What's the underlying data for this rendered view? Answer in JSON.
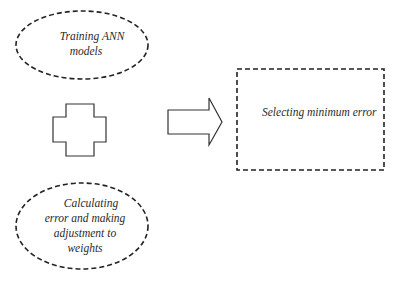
{
  "diagram": {
    "nodes": {
      "training": {
        "lines": [
          "Training ANN",
          "models"
        ]
      },
      "calculating": {
        "lines": [
          "Calculating",
          "error and making",
          "adjustment to",
          "weights"
        ]
      },
      "selecting": {
        "label": "Selecting minimum  error"
      }
    },
    "symbols": {
      "combine": "plus-cross-icon",
      "flow": "right-arrow-icon"
    },
    "colors": {
      "stroke": "#222222",
      "text": "#2a2a2a",
      "background": "#ffffff"
    }
  }
}
